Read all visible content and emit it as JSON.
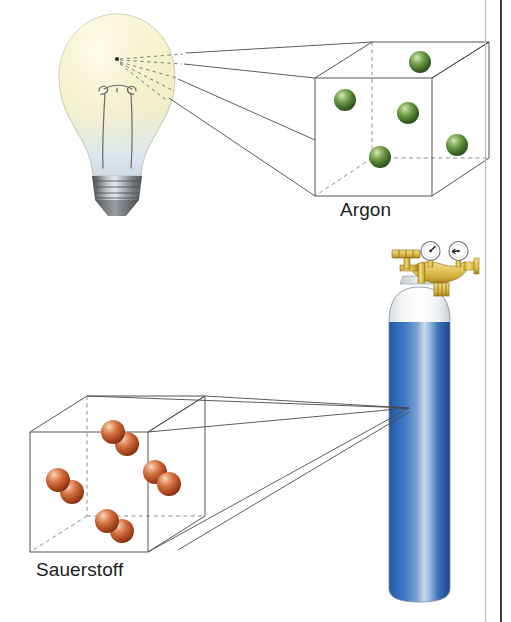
{
  "figure": {
    "kind": "illustration",
    "language": "de"
  },
  "labels": {
    "argon": "Argon",
    "oxygen": "Sauerstoff"
  },
  "colors": {
    "argon_sphere": "#4c7a32",
    "argon_sphere_dark": "#2f4f1d",
    "argon_sphere_highlight": "#b9d49a",
    "oxygen_sphere": "#c4542c",
    "oxygen_sphere_dark": "#8c3517",
    "oxygen_sphere_highlight": "#f0b79a",
    "cylinder_blue": "#2a62b0",
    "cylinder_blue_dark": "#1b4b8f",
    "cylinder_highlight": "#c9d8ea",
    "cylinder_shoulder": "#ffffff",
    "regulator_brass": "#e2c258",
    "regulator_brass_dark": "#b28f24",
    "gauge_face": "#ffffff",
    "bulb_glass_warm": "#f6f0cf",
    "bulb_glass_cool": "#e3e9ef",
    "bulb_base_metal": "#6f7173",
    "line_stroke": "#4a4a48",
    "page_rule": "#3c3f41"
  },
  "scenes": [
    {
      "id": "argon-scene",
      "source_object": "incandescent-light-bulb",
      "magnified_box": "argon-cube",
      "label": "Argon",
      "particle_model": "single atoms",
      "particle_count": 5,
      "particles": [
        {
          "cx": 420,
          "cy": 62,
          "r": 11
        },
        {
          "cx": 345,
          "cy": 100,
          "r": 11
        },
        {
          "cx": 408,
          "cy": 113,
          "r": 11
        },
        {
          "cx": 380,
          "cy": 157,
          "r": 11
        },
        {
          "cx": 457,
          "cy": 145,
          "r": 11
        }
      ]
    },
    {
      "id": "oxygen-scene",
      "source_object": "gas-cylinder",
      "magnified_box": "oxygen-cube",
      "label": "Sauerstoff",
      "particle_model": "diatomic molecules",
      "particle_count": 4,
      "molecules": [
        {
          "x1": 113,
          "y1": 432,
          "x2": 127,
          "y2": 444,
          "r": 12
        },
        {
          "x1": 58,
          "y1": 480,
          "x2": 72,
          "y2": 492,
          "r": 12
        },
        {
          "x1": 155,
          "y1": 472,
          "x2": 169,
          "y2": 484,
          "r": 12
        },
        {
          "x1": 107,
          "y1": 521,
          "x2": 122,
          "y2": 531,
          "r": 12
        }
      ]
    }
  ],
  "objects": {
    "light_bulb": {
      "name": "Glühlampe",
      "parts": [
        "glass-envelope",
        "filament",
        "filament-supports",
        "screw-base"
      ]
    },
    "gas_cylinder": {
      "name": "Gasflasche",
      "parts": [
        "cylinder-body",
        "cylinder-shoulder",
        "pressure-regulator",
        "gauge-left",
        "gauge-right",
        "valve-handle"
      ],
      "gauge_count": 2
    }
  }
}
